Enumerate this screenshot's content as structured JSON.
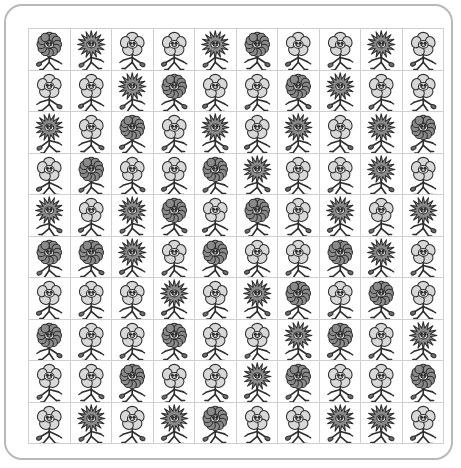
{
  "worksheet": {
    "title": "Flower Character Grid",
    "frame_border_color": "#b9b9b9",
    "grid_line_color": "#cfcfcf",
    "background_color": "#ffffff",
    "rows": 10,
    "columns": 10,
    "total_cells": 100
  },
  "legend": {
    "types": [
      {
        "key": "dark-round",
        "label": "Dark round-petal flower",
        "petal_fill": "#8a8a8a",
        "petal_stroke": "#3a3a3a",
        "petal_shape": "round",
        "petal_count": 12,
        "count": 20
      },
      {
        "key": "dark-spiky",
        "label": "Dark spiky-petal flower",
        "petal_fill": "#8a8a8a",
        "petal_stroke": "#3a3a3a",
        "petal_shape": "spiky",
        "petal_count": 16,
        "count": 29
      },
      {
        "key": "light-round",
        "label": "Light five-petal flower",
        "petal_fill": "#d8d8d8",
        "petal_stroke": "#3a3a3a",
        "petal_shape": "five-petal",
        "petal_count": 5,
        "count": 51
      }
    ],
    "stem_color": "#ffffff",
    "outline_color": "#2e2e2e",
    "leaf_fill": "#6e6e6e",
    "face_fill": "#e8e8e8"
  },
  "grid": {
    "cells": [
      [
        "dark-round",
        "dark-spiky",
        "light-round",
        "light-round",
        "dark-spiky",
        "dark-round",
        "light-round",
        "light-round",
        "dark-spiky",
        "light-round"
      ],
      [
        "light-round",
        "light-round",
        "dark-spiky",
        "dark-round",
        "light-round",
        "light-round",
        "dark-round",
        "dark-spiky",
        "light-round",
        "light-round"
      ],
      [
        "dark-spiky",
        "light-round",
        "dark-round",
        "light-round",
        "dark-spiky",
        "light-round",
        "dark-spiky",
        "light-round",
        "dark-spiky",
        "dark-round"
      ],
      [
        "light-round",
        "dark-round",
        "light-round",
        "light-round",
        "dark-round",
        "dark-spiky",
        "light-round",
        "light-round",
        "dark-spiky",
        "light-round"
      ],
      [
        "dark-spiky",
        "light-round",
        "dark-spiky",
        "dark-round",
        "light-round",
        "dark-round",
        "light-round",
        "dark-spiky",
        "light-round",
        "dark-spiky"
      ],
      [
        "dark-round",
        "dark-round",
        "dark-spiky",
        "light-round",
        "dark-round",
        "light-round",
        "light-round",
        "dark-round",
        "dark-spiky",
        "light-round"
      ],
      [
        "light-round",
        "light-round",
        "light-round",
        "dark-spiky",
        "light-round",
        "dark-spiky",
        "dark-round",
        "light-round",
        "dark-round",
        "light-round"
      ],
      [
        "dark-round",
        "light-round",
        "light-round",
        "dark-round",
        "light-round",
        "light-round",
        "dark-spiky",
        "dark-round",
        "light-round",
        "dark-spiky"
      ],
      [
        "light-round",
        "light-round",
        "dark-round",
        "light-round",
        "light-round",
        "dark-spiky",
        "dark-round",
        "light-round",
        "light-round",
        "dark-round"
      ],
      [
        "light-round",
        "dark-spiky",
        "light-round",
        "dark-spiky",
        "dark-round",
        "light-round",
        "light-round",
        "dark-spiky",
        "dark-spiky",
        "light-round"
      ]
    ]
  }
}
